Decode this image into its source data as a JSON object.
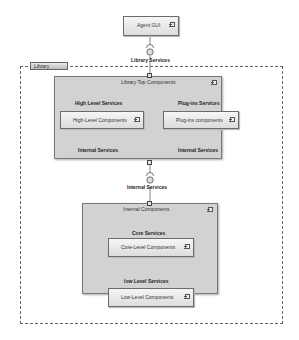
{
  "diagram": {
    "type": "uml-component-diagram",
    "package": {
      "label": "Library"
    },
    "top_component": {
      "label": "Agent GUI"
    },
    "interfaces": {
      "library_services": "Library Services",
      "high_level_services": "High Level Services",
      "plugin_services": "Plug-ins Services",
      "internal_services_left": "Internal Services",
      "internal_services_right": "Internal Services",
      "internal_services_mid": "Internal Services",
      "core_services": "Core Services",
      "low_level_services": "low Level Services"
    },
    "groups": {
      "top_components": {
        "label": "Library Top Components"
      },
      "internal_components": {
        "label": "Internal Components"
      }
    },
    "components": {
      "high_level": "High-Level Components",
      "plugins": "Plug-ins components",
      "core_level": "Core-Level Components",
      "low_level": "Low-Level Components"
    }
  }
}
